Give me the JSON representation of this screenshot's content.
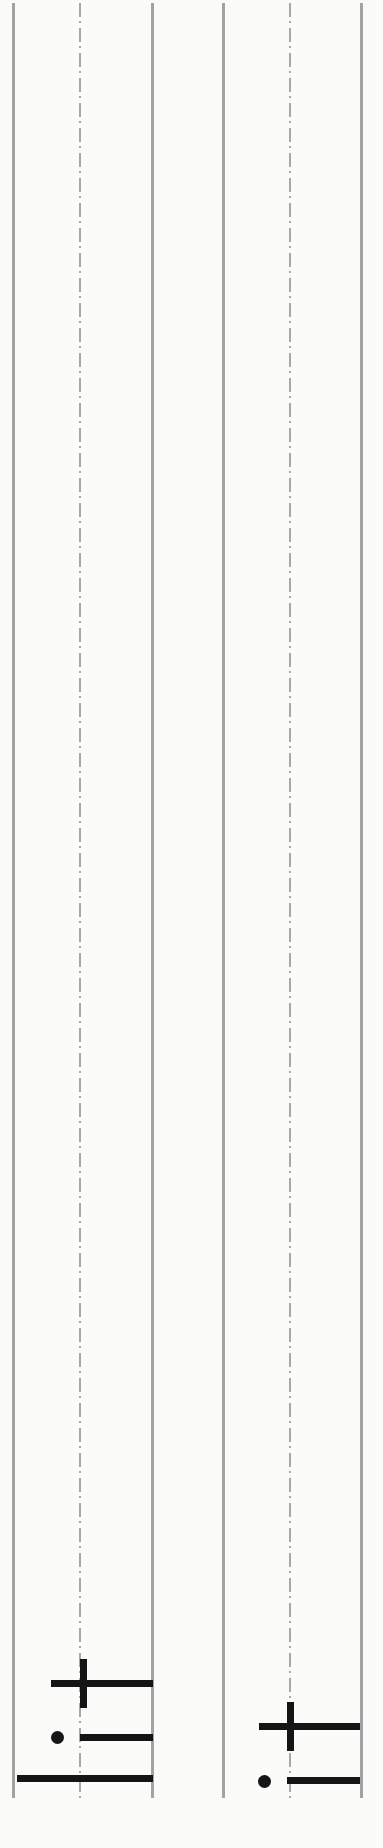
{
  "diagram": {
    "title": "",
    "background": "#fbfbfa",
    "guide_color": "#a3a3a3",
    "mark_color": "#151515",
    "columns": [
      {
        "name": "left-staff",
        "lines": [
          {
            "type": "solid",
            "x": 13
          },
          {
            "type": "dash-dot",
            "x": 80
          },
          {
            "type": "solid",
            "x": 152
          }
        ],
        "marks": [
          {
            "kind": "cross",
            "h_bar": {
              "x1": 51,
              "x2": 153,
              "y": 1683
            },
            "v_bar": {
              "x": 83,
              "y1": 1659,
              "y2": 1708
            }
          },
          {
            "kind": "dot-bar",
            "dot": {
              "cx": 57,
              "cy": 1737
            },
            "bar": {
              "x1": 80,
              "x2": 153,
              "y": 1737
            }
          },
          {
            "kind": "long-bar",
            "bar": {
              "x1": 17,
              "x2": 153,
              "y": 1778
            }
          }
        ]
      },
      {
        "name": "right-staff",
        "lines": [
          {
            "type": "solid",
            "x": 223
          },
          {
            "type": "dash-dot",
            "x": 289
          },
          {
            "type": "solid",
            "x": 361
          }
        ],
        "marks": [
          {
            "kind": "cross",
            "h_bar": {
              "x1": 259,
              "x2": 360,
              "y": 1726
            },
            "v_bar": {
              "x": 290,
              "y1": 1702,
              "y2": 1751
            }
          },
          {
            "kind": "dot-bar",
            "dot": {
              "cx": 264,
              "cy": 1781
            },
            "bar": {
              "x1": 287,
              "x2": 360,
              "y": 1780
            }
          }
        ]
      }
    ]
  }
}
